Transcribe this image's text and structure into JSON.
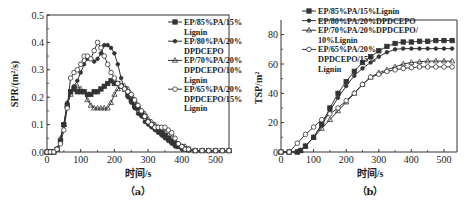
{
  "chart_data": [
    {
      "panel": "(a)",
      "type": "line",
      "title": "",
      "xlabel": "时间/s",
      "ylabel": "SPR/(m²/s)",
      "xlim": [
        0,
        540
      ],
      "ylim": [
        0,
        0.5
      ],
      "xticks": [
        0,
        100,
        200,
        300,
        400,
        500
      ],
      "xtick_labels": [
        "0",
        "100",
        "200",
        "300",
        "400",
        "500"
      ],
      "yticks": [
        0.0,
        0.1,
        0.2,
        0.3,
        0.4,
        0.5
      ],
      "ytick_labels": [
        "0.0",
        "0.1",
        "0.2",
        "0.3",
        "0.4",
        "0.5"
      ],
      "grid": false,
      "legend_position": "upper right",
      "series": [
        {
          "name": "EP/85%PA/15%Lignin",
          "legend_lines": [
            "EP/85%PA/15%",
            "Lignin"
          ],
          "marker": "square",
          "x": [
            0,
            10,
            20,
            30,
            40,
            50,
            60,
            70,
            80,
            90,
            100,
            110,
            120,
            130,
            140,
            150,
            160,
            170,
            180,
            190,
            200,
            210,
            220,
            230,
            240,
            250,
            260,
            270,
            280,
            290,
            300,
            310,
            320,
            330,
            340,
            350,
            360,
            370,
            380,
            390,
            400,
            410,
            420,
            440,
            460,
            480,
            500,
            520,
            540
          ],
          "y": [
            0,
            0,
            0,
            0.01,
            0.04,
            0.1,
            0.17,
            0.22,
            0.23,
            0.22,
            0.22,
            0.22,
            0.21,
            0.21,
            0.22,
            0.22,
            0.23,
            0.24,
            0.25,
            0.26,
            0.25,
            0.25,
            0.24,
            0.23,
            0.21,
            0.19,
            0.17,
            0.16,
            0.14,
            0.13,
            0.11,
            0.1,
            0.09,
            0.08,
            0.07,
            0.06,
            0.05,
            0.04,
            0.03,
            0.02,
            0.02,
            0.01,
            0.01,
            0.005,
            0.005,
            0.005,
            0.005,
            0.005,
            0.005
          ]
        },
        {
          "name": "EP/80%PA/20%DPDCEPO",
          "legend_lines": [
            "EP/80%PA/20%",
            "DPDCEPO"
          ],
          "marker": "dot",
          "x": [
            0,
            10,
            20,
            30,
            40,
            50,
            60,
            70,
            80,
            90,
            100,
            110,
            120,
            130,
            140,
            150,
            160,
            170,
            180,
            190,
            200,
            210,
            220,
            230,
            240,
            250,
            260,
            270,
            280,
            290,
            300,
            310,
            320,
            330,
            340,
            350,
            360,
            370,
            380,
            390,
            400,
            410,
            420,
            440,
            460,
            480,
            500,
            520,
            540
          ],
          "y": [
            0,
            0,
            0,
            0.01,
            0.04,
            0.1,
            0.18,
            0.22,
            0.24,
            0.26,
            0.29,
            0.32,
            0.34,
            0.34,
            0.33,
            0.34,
            0.36,
            0.39,
            0.39,
            0.38,
            0.36,
            0.32,
            0.27,
            0.23,
            0.2,
            0.18,
            0.16,
            0.14,
            0.13,
            0.11,
            0.1,
            0.09,
            0.08,
            0.07,
            0.06,
            0.05,
            0.04,
            0.03,
            0.02,
            0.02,
            0.01,
            0.01,
            0.005,
            0.005,
            0.005,
            0.005,
            0.005,
            0.005,
            0.005
          ]
        },
        {
          "name": "EP/70%PA/20%DPDCEPO/10%Lignin",
          "legend_lines": [
            "EP/70%PA/20%",
            "DPDCEPO/10%",
            "Lignin"
          ],
          "marker": "triangle",
          "x": [
            0,
            10,
            20,
            30,
            40,
            50,
            60,
            70,
            80,
            90,
            100,
            110,
            120,
            130,
            140,
            150,
            160,
            170,
            180,
            190,
            200,
            210,
            220,
            230,
            240,
            250,
            260,
            270,
            280,
            290,
            300,
            310,
            320,
            330,
            340,
            350,
            360,
            370,
            380,
            390,
            400,
            410,
            420,
            440,
            460,
            480,
            500,
            520,
            540
          ],
          "y": [
            0,
            0,
            0,
            0.01,
            0.05,
            0.1,
            0.17,
            0.21,
            0.23,
            0.24,
            0.23,
            0.22,
            0.19,
            0.17,
            0.16,
            0.16,
            0.16,
            0.16,
            0.16,
            0.18,
            0.21,
            0.23,
            0.24,
            0.24,
            0.23,
            0.21,
            0.19,
            0.17,
            0.15,
            0.14,
            0.12,
            0.11,
            0.1,
            0.09,
            0.08,
            0.07,
            0.06,
            0.05,
            0.04,
            0.03,
            0.02,
            0.02,
            0.01,
            0.005,
            0.005,
            0.005,
            0.005,
            0.005,
            0.005
          ]
        },
        {
          "name": "EP/65%PA/20%DPDCEPO/15%Lignin",
          "legend_lines": [
            "EP/65%PA/20%",
            "DPDCEPO/15%",
            "Lignin"
          ],
          "marker": "circle",
          "x": [
            0,
            10,
            20,
            30,
            40,
            50,
            60,
            70,
            80,
            90,
            100,
            110,
            120,
            130,
            140,
            150,
            160,
            170,
            180,
            190,
            200,
            210,
            220,
            230,
            240,
            250,
            260,
            270,
            280,
            290,
            300,
            310,
            320,
            330,
            340,
            350,
            360,
            370,
            380,
            390,
            400,
            410,
            420,
            440,
            460,
            480,
            500,
            520,
            540
          ],
          "y": [
            0,
            0,
            0,
            0.01,
            0.03,
            0.08,
            0.16,
            0.27,
            0.29,
            0.3,
            0.32,
            0.35,
            0.35,
            0.34,
            0.37,
            0.4,
            0.38,
            0.35,
            0.32,
            0.29,
            0.27,
            0.25,
            0.24,
            0.23,
            0.22,
            0.21,
            0.19,
            0.17,
            0.15,
            0.13,
            0.11,
            0.1,
            0.09,
            0.09,
            0.09,
            0.09,
            0.08,
            0.07,
            0.05,
            0.03,
            0.02,
            0.01,
            0.01,
            0.005,
            0.005,
            0.005,
            0.005,
            0.005,
            0.005
          ]
        }
      ]
    },
    {
      "panel": "(b)",
      "type": "line",
      "title": "",
      "xlabel": "时间/s",
      "ylabel": "TSP/m²",
      "xlim": [
        0,
        540
      ],
      "ylim": [
        0,
        90
      ],
      "xticks": [
        0,
        100,
        200,
        300,
        400,
        500
      ],
      "xtick_labels": [
        "0",
        "100",
        "200",
        "300",
        "400",
        "500"
      ],
      "yticks": [
        0,
        20,
        40,
        60,
        80
      ],
      "ytick_labels": [
        "0",
        "20",
        "40",
        "60",
        "80"
      ],
      "grid": false,
      "legend_position": "upper left",
      "series": [
        {
          "name": "EP/85%PA/15%Lignin",
          "legend_lines": [
            "EP/85%PA/15%Lignin"
          ],
          "marker": "square",
          "x": [
            0,
            25,
            50,
            60,
            75,
            100,
            125,
            150,
            175,
            200,
            225,
            250,
            275,
            300,
            325,
            350,
            375,
            400,
            425,
            450,
            475,
            500,
            525
          ],
          "y": [
            0,
            0,
            0,
            1,
            4,
            10,
            19,
            30,
            40,
            48,
            55,
            61,
            65,
            69,
            72,
            74,
            75,
            75,
            75.5,
            75.5,
            76,
            76,
            76
          ]
        },
        {
          "name": "EP/80%PA/20%DPDCEPO",
          "legend_lines": [
            "EP/80%PA/20%DPDCEPO"
          ],
          "marker": "dot",
          "x": [
            0,
            25,
            50,
            60,
            75,
            100,
            125,
            150,
            175,
            200,
            225,
            250,
            275,
            300,
            325,
            350,
            375,
            400,
            425,
            450,
            475,
            500,
            525
          ],
          "y": [
            0,
            0,
            0,
            1,
            4,
            10,
            18,
            28,
            37,
            45,
            52,
            57,
            61,
            65,
            68,
            70,
            70.5,
            70.5,
            70.5,
            70.5,
            70.5,
            70.5,
            70.5
          ]
        },
        {
          "name": "EP/70%PA/20%DPDCEPO/10%Lignin",
          "legend_lines": [
            "EP/70%PA/20%DPDCEPO/",
            "10%Lignin"
          ],
          "marker": "triangle",
          "x": [
            0,
            25,
            50,
            60,
            75,
            100,
            125,
            150,
            175,
            200,
            225,
            250,
            275,
            300,
            325,
            350,
            375,
            400,
            425,
            450,
            475,
            500,
            525
          ],
          "y": [
            0,
            0,
            0,
            1,
            4,
            10,
            16,
            22,
            28,
            34,
            40,
            46,
            51,
            54,
            56,
            58,
            60,
            61,
            61.5,
            62,
            62,
            62,
            62
          ]
        },
        {
          "name": "EP/65%PA/20%DPDCEPO/15%Lignin",
          "legend_lines": [
            "EP/65%PA/20%",
            "DPDCEPO/15%",
            "Lignin"
          ],
          "marker": "circle",
          "x": [
            0,
            25,
            50,
            75,
            100,
            125,
            150,
            175,
            200,
            225,
            250,
            275,
            300,
            325,
            350,
            375,
            400,
            425,
            450,
            475,
            500,
            525
          ],
          "y": [
            0,
            0,
            6,
            12,
            17,
            22,
            26,
            30,
            35,
            40,
            46,
            51,
            53,
            55,
            56,
            57,
            57.5,
            58,
            58,
            58,
            58,
            58
          ]
        }
      ]
    }
  ],
  "captions": {
    "a": "（a）",
    "b": "（b）"
  }
}
